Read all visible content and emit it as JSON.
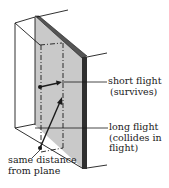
{
  "diagram": {
    "type": "3d-slab-with-flight-paths",
    "colors": {
      "panel_fill": "#c9c9c9",
      "panel_edge": "#3a3a3a",
      "line": "#1a1a1a",
      "background": "#ffffff"
    },
    "labels": {
      "short_flight": {
        "line1": "short flight",
        "line2": "(survives)"
      },
      "long_flight": {
        "line1": "long flight",
        "line2": "(collides in",
        "line3": "flight)"
      },
      "same_distance": {
        "line1": "same distance",
        "line2": "from plane"
      }
    }
  }
}
